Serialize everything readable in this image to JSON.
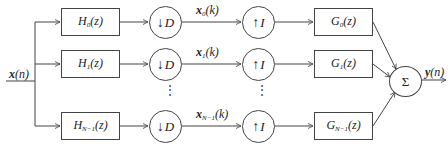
{
  "diagram": {
    "title": "",
    "input": {
      "name": "x",
      "arg": "n"
    },
    "output": {
      "name": "y",
      "arg": "n"
    },
    "analysis_filters": [
      {
        "name": "H",
        "sub": "0",
        "arg": "z"
      },
      {
        "name": "H",
        "sub": "1",
        "arg": "z"
      },
      {
        "name": "H",
        "sub": "N−1",
        "arg": "z"
      }
    ],
    "decimators": [
      {
        "symbol": "↓",
        "factor": "D"
      },
      {
        "symbol": "↓",
        "factor": "D"
      },
      {
        "symbol": "↓",
        "factor": "D"
      }
    ],
    "subband_signals": [
      {
        "name": "x",
        "sub": "0",
        "arg": "k"
      },
      {
        "name": "x",
        "sub": "1",
        "arg": "k"
      },
      {
        "name": "x",
        "sub": "N−1",
        "arg": "k"
      }
    ],
    "interpolators": [
      {
        "symbol": "↑",
        "factor": "I"
      },
      {
        "symbol": "↑",
        "factor": "I"
      },
      {
        "symbol": "↑",
        "factor": "I"
      }
    ],
    "synthesis_filters": [
      {
        "name": "G",
        "sub": "0",
        "arg": "z"
      },
      {
        "name": "G",
        "sub": "1",
        "arg": "z"
      },
      {
        "name": "G",
        "sub": "N−1",
        "arg": "z"
      }
    ],
    "summer": {
      "symbol": "Σ"
    },
    "ellipsis": "⋮"
  }
}
